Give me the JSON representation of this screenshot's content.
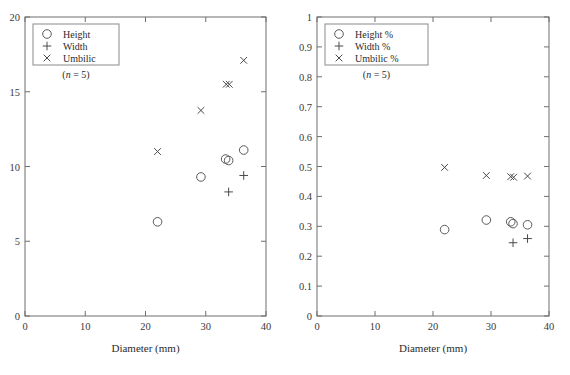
{
  "figure": {
    "width": 570,
    "height": 375,
    "background": "#ffffff",
    "stroke_color": "#6e6e6e",
    "marker_color": "#4a4a4a"
  },
  "panels": [
    {
      "id": "left",
      "name": "absolute-measurements",
      "xlabel": "Diameter (mm)",
      "ylabel": "",
      "xlim": [
        0,
        40
      ],
      "ylim": [
        0,
        20
      ],
      "xticks": [
        "0",
        "10",
        "20",
        "30",
        "40"
      ],
      "xtick_values": [
        0,
        10,
        20,
        30,
        40
      ],
      "yticks": [
        "0",
        "5",
        "10",
        "15",
        "20"
      ],
      "ytick_values": [
        0,
        5,
        10,
        15,
        20
      ],
      "grid": false,
      "legend_position": "upper-left",
      "legend": {
        "entries": [
          {
            "label": "Height",
            "marker": "circle-marker"
          },
          {
            "label": "Width",
            "marker": "plus-marker"
          },
          {
            "label": "Umbilic",
            "marker": "cross-marker"
          }
        ],
        "note_prefix": "(",
        "note_italic": "n",
        "note_suffix": " = 5)"
      }
    },
    {
      "id": "right",
      "name": "relative-measurements",
      "xlabel": "Diameter (mm)",
      "ylabel": "",
      "xlim": [
        0,
        40
      ],
      "ylim": [
        0,
        1
      ],
      "xticks": [
        "0",
        "10",
        "20",
        "30",
        "40"
      ],
      "xtick_values": [
        0,
        10,
        20,
        30,
        40
      ],
      "yticks": [
        "0",
        "0.1",
        "0.2",
        "0.3",
        "0.4",
        "0.5",
        "0.6",
        "0.7",
        "0.8",
        "0.9",
        "1"
      ],
      "ytick_values": [
        0,
        0.1,
        0.2,
        0.3,
        0.4,
        0.5,
        0.6,
        0.7,
        0.8,
        0.9,
        1
      ],
      "grid": false,
      "legend_position": "upper-left",
      "legend": {
        "entries": [
          {
            "label": "Height %",
            "marker": "circle-marker"
          },
          {
            "label": "Width %",
            "marker": "plus-marker"
          },
          {
            "label": "Umbilic %",
            "marker": "cross-marker"
          }
        ],
        "note_prefix": "(",
        "note_italic": "n",
        "note_suffix": " = 5)"
      }
    }
  ],
  "chart_data": [
    {
      "type": "scatter",
      "panel": "left",
      "title": "",
      "xlabel": "Diameter (mm)",
      "ylabel": "",
      "xlim": [
        0,
        40
      ],
      "ylim": [
        0,
        20
      ],
      "grid": false,
      "legend_position": "upper-left",
      "annotations": [
        "(n = 5)"
      ],
      "series": [
        {
          "name": "Height",
          "marker": "circle",
          "points": [
            [
              22.0,
              6.3
            ],
            [
              29.2,
              9.3
            ],
            [
              33.3,
              10.5
            ],
            [
              33.8,
              10.4
            ],
            [
              36.3,
              11.1
            ]
          ]
        },
        {
          "name": "Width",
          "marker": "plus",
          "points": [
            [
              33.8,
              8.3
            ],
            [
              36.3,
              9.4
            ]
          ]
        },
        {
          "name": "Umbilic",
          "marker": "cross",
          "points": [
            [
              22.0,
              11.0
            ],
            [
              29.2,
              13.75
            ],
            [
              33.4,
              15.5
            ],
            [
              33.9,
              15.5
            ],
            [
              36.3,
              17.1
            ]
          ]
        }
      ]
    },
    {
      "type": "scatter",
      "panel": "right",
      "title": "",
      "xlabel": "Diameter (mm)",
      "ylabel": "",
      "xlim": [
        0,
        40
      ],
      "ylim": [
        0,
        1
      ],
      "grid": false,
      "legend_position": "upper-left",
      "annotations": [
        "(n = 5)"
      ],
      "series": [
        {
          "name": "Height %",
          "marker": "circle",
          "points": [
            [
              22.0,
              0.289
            ],
            [
              29.2,
              0.321
            ],
            [
              33.4,
              0.315
            ],
            [
              33.8,
              0.309
            ],
            [
              36.3,
              0.305
            ]
          ]
        },
        {
          "name": "Width %",
          "marker": "plus",
          "points": [
            [
              33.8,
              0.245
            ],
            [
              36.3,
              0.259
            ]
          ]
        },
        {
          "name": "Umbilic %",
          "marker": "cross",
          "points": [
            [
              22.0,
              0.497
            ],
            [
              29.2,
              0.47
            ],
            [
              33.4,
              0.466
            ],
            [
              33.9,
              0.464
            ],
            [
              36.3,
              0.468
            ]
          ]
        }
      ]
    }
  ]
}
